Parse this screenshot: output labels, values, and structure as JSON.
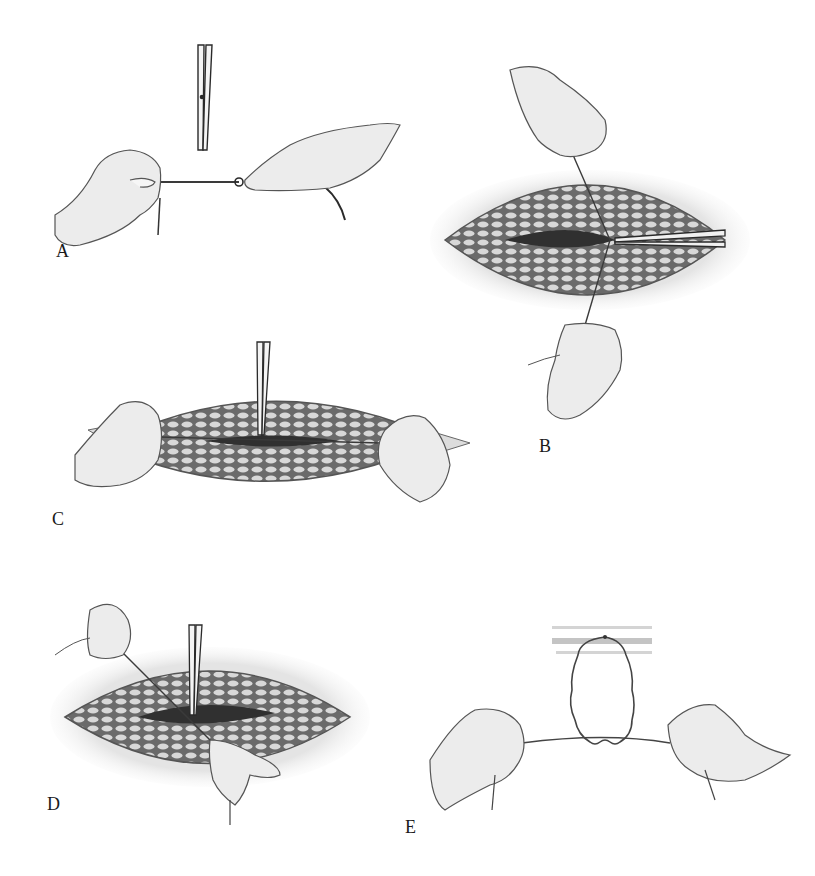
{
  "figure": {
    "type": "surgical-illustration",
    "colors": {
      "background": "#ffffff",
      "ink": "#2a2a2a",
      "skin": "#ececec",
      "tissue_dark": "#5a5a5a",
      "fat_cells": "#d9d9d9",
      "wound": "#303030"
    },
    "panels": [
      {
        "id": "A",
        "label": "A",
        "description": "Two hands hold suture taut; forceps vertical at knot point"
      },
      {
        "id": "B",
        "label": "B",
        "description": "Elliptical wound; suture pulled vertically by top and bottom hands; needle holder from right"
      },
      {
        "id": "C",
        "label": "C",
        "description": "Wound viewed horizontally; hands pull suture ends left and right; forceps vertical at center"
      },
      {
        "id": "D",
        "label": "D",
        "description": "Elliptical wound; suture drawn diagonally from upper-left hand to lower hand; forceps vertical"
      },
      {
        "id": "E",
        "label": "E",
        "description": "Schematic loop beneath tissue bands; square knot formed between two hands"
      }
    ]
  }
}
